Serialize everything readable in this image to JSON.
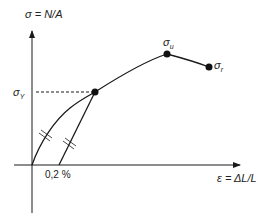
{
  "diagram": {
    "y_axis": {
      "label": "σ = N/A"
    },
    "x_axis": {
      "label": "ε = ΔL/L"
    },
    "points": {
      "yield": {
        "symbol": "σ",
        "subscript": "Y"
      },
      "ultimate": {
        "symbol": "σ",
        "subscript": "u"
      },
      "rupture": {
        "symbol": "σ",
        "subscript": "r"
      }
    },
    "offset_label": "0,2 %",
    "colors": {
      "line": "#1a1a1a",
      "text": "#222222",
      "background": "#ffffff"
    }
  }
}
